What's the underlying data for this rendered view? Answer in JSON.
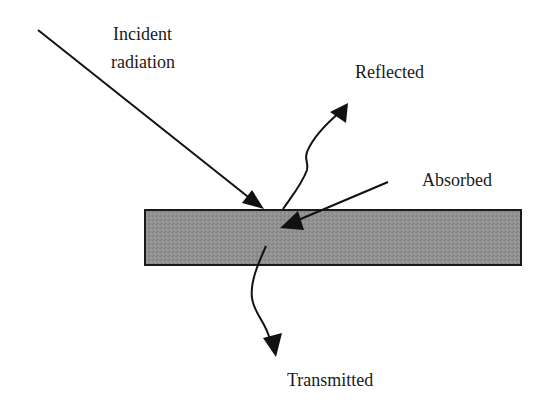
{
  "diagram": {
    "labels": {
      "incident_line1": "Incident",
      "incident_line2": "radiation",
      "reflected": "Reflected",
      "absorbed": "Absorbed",
      "transmitted": "Transmitted"
    },
    "colors": {
      "slab_fill": "#8f8f8f",
      "slab_border": "#1a1a1a",
      "stroke": "#111111",
      "text": "#1a1a1a"
    }
  }
}
